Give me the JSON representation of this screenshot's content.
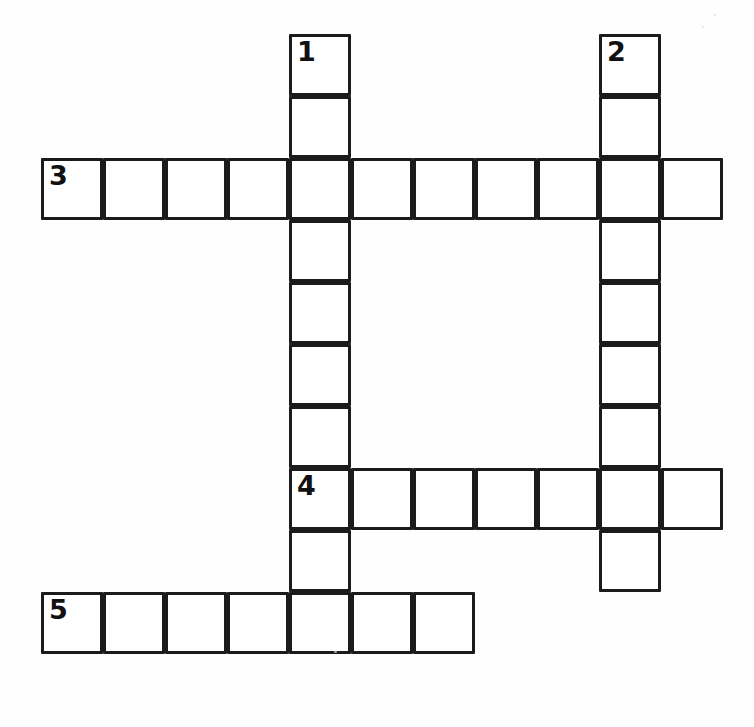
{
  "page": {
    "background_color": "#ffffff",
    "width": 754,
    "height": 727
  },
  "grid": {
    "cell_size": 62,
    "origin_x": 41,
    "origin_y": 34,
    "line_color": "#1b1b1b",
    "line_width": 3,
    "cell_fill": "#ffffff",
    "columns": 11,
    "rows": 10,
    "number_color": "#111111"
  },
  "clue_numbers": [
    {
      "number": "1",
      "row": 0,
      "col": 4,
      "direction": "down"
    },
    {
      "number": "2",
      "row": 0,
      "col": 9,
      "direction": "down"
    },
    {
      "number": "3",
      "row": 2,
      "col": 0,
      "direction": "across"
    },
    {
      "number": "4",
      "row": 7,
      "col": 4,
      "direction": "across"
    },
    {
      "number": "5",
      "row": 9,
      "col": 0,
      "direction": "across"
    }
  ],
  "entries": [
    {
      "number": "1",
      "direction": "down",
      "row": 0,
      "col": 4,
      "length": 10
    },
    {
      "number": "2",
      "direction": "down",
      "row": 0,
      "col": 9,
      "length": 9
    },
    {
      "number": "3",
      "direction": "across",
      "row": 2,
      "col": 0,
      "length": 11
    },
    {
      "number": "4",
      "direction": "across",
      "row": 7,
      "col": 4,
      "length": 7
    },
    {
      "number": "5",
      "direction": "across",
      "row": 9,
      "col": 0,
      "length": 7
    }
  ],
  "cells": [
    {
      "row": 0,
      "col": 4,
      "number": "1",
      "letter": ""
    },
    {
      "row": 0,
      "col": 9,
      "number": "2",
      "letter": ""
    },
    {
      "row": 1,
      "col": 4,
      "number": "",
      "letter": ""
    },
    {
      "row": 1,
      "col": 9,
      "number": "",
      "letter": ""
    },
    {
      "row": 2,
      "col": 0,
      "number": "3",
      "letter": ""
    },
    {
      "row": 2,
      "col": 1,
      "number": "",
      "letter": ""
    },
    {
      "row": 2,
      "col": 2,
      "number": "",
      "letter": ""
    },
    {
      "row": 2,
      "col": 3,
      "number": "",
      "letter": ""
    },
    {
      "row": 2,
      "col": 4,
      "number": "",
      "letter": ""
    },
    {
      "row": 2,
      "col": 5,
      "number": "",
      "letter": ""
    },
    {
      "row": 2,
      "col": 6,
      "number": "",
      "letter": ""
    },
    {
      "row": 2,
      "col": 7,
      "number": "",
      "letter": ""
    },
    {
      "row": 2,
      "col": 8,
      "number": "",
      "letter": ""
    },
    {
      "row": 2,
      "col": 9,
      "number": "",
      "letter": ""
    },
    {
      "row": 2,
      "col": 10,
      "number": "",
      "letter": ""
    },
    {
      "row": 3,
      "col": 4,
      "number": "",
      "letter": ""
    },
    {
      "row": 3,
      "col": 9,
      "number": "",
      "letter": ""
    },
    {
      "row": 4,
      "col": 4,
      "number": "",
      "letter": ""
    },
    {
      "row": 4,
      "col": 9,
      "number": "",
      "letter": ""
    },
    {
      "row": 5,
      "col": 4,
      "number": "",
      "letter": ""
    },
    {
      "row": 5,
      "col": 9,
      "number": "",
      "letter": ""
    },
    {
      "row": 6,
      "col": 4,
      "number": "",
      "letter": ""
    },
    {
      "row": 6,
      "col": 9,
      "number": "",
      "letter": ""
    },
    {
      "row": 7,
      "col": 4,
      "number": "4",
      "letter": ""
    },
    {
      "row": 7,
      "col": 5,
      "number": "",
      "letter": ""
    },
    {
      "row": 7,
      "col": 6,
      "number": "",
      "letter": ""
    },
    {
      "row": 7,
      "col": 7,
      "number": "",
      "letter": ""
    },
    {
      "row": 7,
      "col": 8,
      "number": "",
      "letter": ""
    },
    {
      "row": 7,
      "col": 9,
      "number": "",
      "letter": ""
    },
    {
      "row": 7,
      "col": 10,
      "number": "",
      "letter": ""
    },
    {
      "row": 8,
      "col": 4,
      "number": "",
      "letter": ""
    },
    {
      "row": 8,
      "col": 9,
      "number": "",
      "letter": ""
    },
    {
      "row": 9,
      "col": 0,
      "number": "5",
      "letter": ""
    },
    {
      "row": 9,
      "col": 1,
      "number": "",
      "letter": ""
    },
    {
      "row": 9,
      "col": 2,
      "number": "",
      "letter": ""
    },
    {
      "row": 9,
      "col": 3,
      "number": "",
      "letter": ""
    },
    {
      "row": 9,
      "col": 4,
      "number": "",
      "letter": ""
    },
    {
      "row": 9,
      "col": 5,
      "number": "",
      "letter": ""
    },
    {
      "row": 9,
      "col": 6,
      "number": "",
      "letter": ""
    }
  ],
  "speckles": [
    {
      "x": 334,
      "y": 650,
      "size": 3
    },
    {
      "x": 714,
      "y": 14,
      "size": 2
    },
    {
      "x": 702,
      "y": 26,
      "size": 2
    }
  ]
}
